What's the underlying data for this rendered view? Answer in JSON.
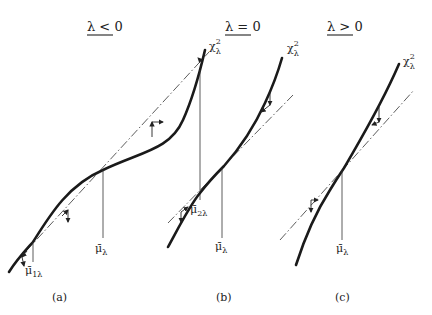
{
  "figure": {
    "panels": [
      {
        "id": "a",
        "title": "λ < 0",
        "caption": "(a)",
        "curve_label_base": "χ",
        "curve_label_sup": "2",
        "curve_label_sub": "λ",
        "markers": [
          {
            "base": "μ̄",
            "sub": "λ"
          },
          {
            "base": "μ̄",
            "sub": "1λ"
          },
          {
            "base": "μ̄",
            "sub": "2λ"
          }
        ]
      },
      {
        "id": "b",
        "title": "λ = 0",
        "caption": "(b)",
        "curve_label_base": "χ",
        "curve_label_sup": "2",
        "curve_label_sub": "λ",
        "markers": [
          {
            "base": "μ̄",
            "sub": "λ"
          }
        ]
      },
      {
        "id": "c",
        "title": "λ > 0",
        "caption": "(c)",
        "curve_label_base": "χ",
        "curve_label_sup": "2",
        "curve_label_sub": "λ",
        "markers": [
          {
            "base": "μ̄",
            "sub": "λ"
          }
        ]
      }
    ]
  }
}
